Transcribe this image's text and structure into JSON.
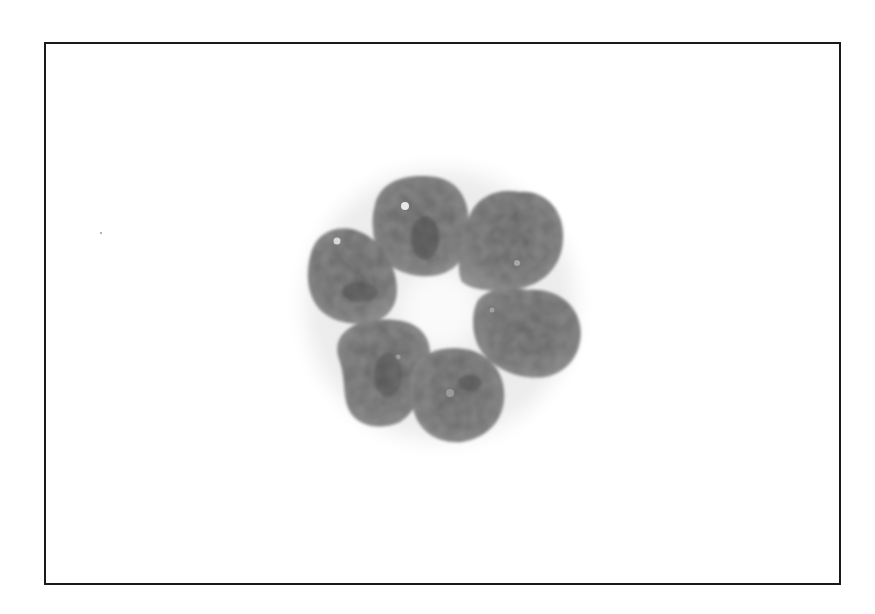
{
  "image": {
    "subject": "six-lobed nucleus cell (flower-shaped), grayscale micrograph",
    "frame_color": "#1a1a1a",
    "background_color": "#ffffff",
    "lobe_color": "#6a6a6a",
    "lobe_dark_color": "#4f4f4f",
    "lobe_count": 6
  }
}
